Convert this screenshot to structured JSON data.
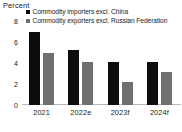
{
  "chart_data": {
    "type": "bar",
    "title": "",
    "ylabel": "Percent",
    "xlabel": "",
    "categories": [
      "2021",
      "2022e",
      "2023f",
      "2024f"
    ],
    "series": [
      {
        "name": "Commodity importers excl. China",
        "color": "#0d0d0d",
        "values": [
          7.0,
          5.2,
          4.1,
          4.1
        ]
      },
      {
        "name": "Commodity exporters excl. Russian Federation",
        "color": "#6f6f6f",
        "values": [
          5.0,
          4.1,
          2.2,
          3.1
        ]
      }
    ],
    "ylim": [
      0,
      8
    ],
    "yticks": [
      0,
      2,
      4,
      6,
      8
    ],
    "ytick_labels": [
      "0",
      "2",
      "4",
      "6",
      "8"
    ],
    "grid": false,
    "legend_position": "top"
  }
}
